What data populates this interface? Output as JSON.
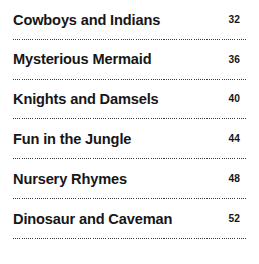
{
  "page": {
    "type": "table-of-contents",
    "background_color": "#ffffff",
    "text_color": "#161616",
    "rule_color": "#3a3a3a",
    "rule_style": "dotted"
  },
  "entries": [
    {
      "title": "Cowboys and Indians",
      "page_number": "32"
    },
    {
      "title": "Mysterious Mermaid",
      "page_number": "36"
    },
    {
      "title": "Knights and Damsels",
      "page_number": "40"
    },
    {
      "title": "Fun in the Jungle",
      "page_number": "44"
    },
    {
      "title": "Nursery Rhymes",
      "page_number": "48"
    },
    {
      "title": "Dinosaur and Caveman",
      "page_number": "52"
    }
  ]
}
